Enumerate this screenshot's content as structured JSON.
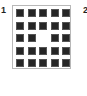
{
  "panels": [
    {
      "label": "1"
    },
    {
      "label": "2"
    }
  ],
  "grid": {
    "rows": 5,
    "cols": 5,
    "filled_color": "#262626",
    "cells": [
      [
        1,
        1,
        1,
        1,
        1
      ],
      [
        1,
        1,
        1,
        1,
        1
      ],
      [
        1,
        1,
        0,
        1,
        1
      ],
      [
        1,
        1,
        1,
        1,
        1
      ],
      [
        1,
        1,
        1,
        1,
        1
      ]
    ]
  }
}
